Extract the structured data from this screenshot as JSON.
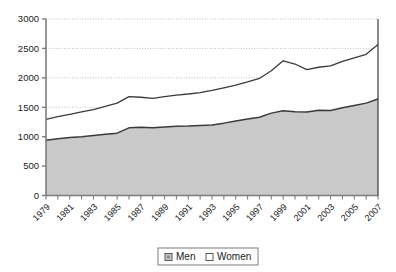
{
  "chart_data": {
    "type": "area",
    "title": "",
    "subtitle": "",
    "xlabel": "",
    "ylabel": "",
    "stacked": true,
    "grid": true,
    "grid_axis": "y",
    "legend_position": "bottom",
    "ylim": [
      0,
      3000
    ],
    "ytick_step": 500,
    "yticks": [
      "0",
      "500",
      "1000",
      "1500",
      "2000",
      "2500",
      "3000"
    ],
    "ytick_values": [
      0,
      500,
      1000,
      1500,
      2000,
      2500,
      3000
    ],
    "x": [
      1979,
      1980,
      1981,
      1982,
      1983,
      1984,
      1985,
      1986,
      1987,
      1988,
      1989,
      1990,
      1991,
      1992,
      1993,
      1994,
      1995,
      1996,
      1997,
      1998,
      1999,
      2000,
      2001,
      2002,
      2003,
      2004,
      2005,
      2006,
      2007
    ],
    "xticks": [
      "1979",
      "1980",
      "1981",
      "1982",
      "1983",
      "1984",
      "1985",
      "1986",
      "1987",
      "1988",
      "1989",
      "1990",
      "1991",
      "1992",
      "1993",
      "1994",
      "1995",
      "1996",
      "1997",
      "1998",
      "1999",
      "2000",
      "2001",
      "2002",
      "2003",
      "2004",
      "2005",
      "2006",
      "2007"
    ],
    "xtick_labels_shown": [
      "1979",
      "1981",
      "1983",
      "1985",
      "1987",
      "1989",
      "1991",
      "1993",
      "1995",
      "1997",
      "1999",
      "2001",
      "2003",
      "2005",
      "2007"
    ],
    "xtick_label_rotation": -45,
    "series": [
      {
        "name": "Men",
        "color": "#c9c9c9",
        "line_color": "#3b3b3b",
        "values": [
          940,
          965,
          985,
          1000,
          1020,
          1040,
          1060,
          1150,
          1160,
          1150,
          1165,
          1175,
          1180,
          1190,
          1200,
          1230,
          1265,
          1300,
          1330,
          1400,
          1440,
          1425,
          1420,
          1450,
          1445,
          1490,
          1530,
          1570,
          1640
        ]
      },
      {
        "name": "Women",
        "color": "#ffffff",
        "line_color": "#3b3b3b",
        "values": [
          355,
          375,
          395,
          420,
          440,
          475,
          510,
          530,
          510,
          500,
          515,
          530,
          545,
          560,
          585,
          600,
          610,
          630,
          660,
          720,
          850,
          810,
          720,
          730,
          760,
          790,
          810,
          830,
          925
        ]
      }
    ],
    "totals": [
      1295,
      1340,
      1380,
      1420,
      1460,
      1515,
      1570,
      1680,
      1670,
      1650,
      1680,
      1705,
      1725,
      1750,
      1785,
      1830,
      1875,
      1930,
      1990,
      2120,
      2290,
      2235,
      2140,
      2180,
      2205,
      2280,
      2340,
      2400,
      2565
    ]
  },
  "legend": {
    "items": [
      {
        "label": "Men",
        "swatch": "men-swatch"
      },
      {
        "label": "Women",
        "swatch": "women-swatch"
      }
    ]
  }
}
